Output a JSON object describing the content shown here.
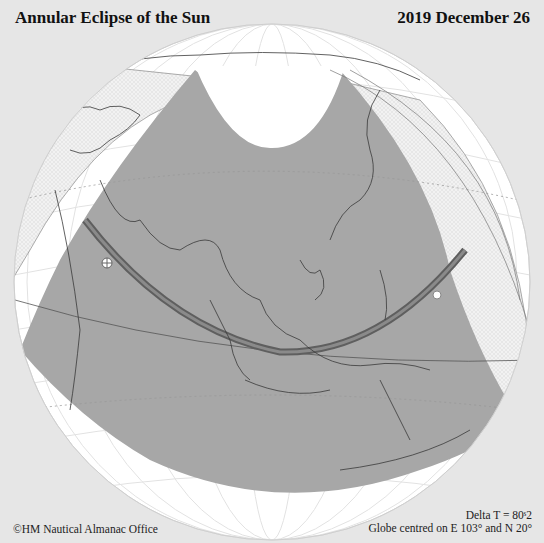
{
  "header": {
    "title": "Annular Eclipse of the Sun",
    "date": "2019 December 26"
  },
  "footer": {
    "credit": "©HM Nautical Almanac Office",
    "delta_t": "Delta T = 80s2",
    "delta_t_display": "Delta T = 80ˢ2",
    "globe_centre": "Globe centred on E 103° and N 20°"
  },
  "map": {
    "projection": "orthographic globe",
    "centre_longitude": "E 103°",
    "centre_latitude": "N 20°",
    "colors": {
      "background": "#e6e6e6",
      "globe": "#ffffff",
      "penumbra_shading": "#a6a6a6",
      "partial_edge_hatch": "#efefef",
      "annular_path": "#707070",
      "coastline": "#333333",
      "graticule": "#e0e0e0"
    },
    "markers": [
      {
        "name": "start-of-annular-path",
        "symbol": "crossed-circle"
      },
      {
        "name": "end-of-annular-path",
        "symbol": "open-circle"
      }
    ]
  }
}
